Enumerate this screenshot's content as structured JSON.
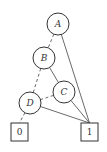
{
  "diagram": {
    "type": "binary-decision-diagram",
    "nodes": [
      {
        "id": "A",
        "label": "A",
        "kind": "variable"
      },
      {
        "id": "B",
        "label": "B",
        "kind": "variable"
      },
      {
        "id": "C",
        "label": "C",
        "kind": "variable"
      },
      {
        "id": "D",
        "label": "D",
        "kind": "variable"
      },
      {
        "id": "T0",
        "label": "0",
        "kind": "terminal"
      },
      {
        "id": "T1",
        "label": "1",
        "kind": "terminal"
      }
    ],
    "edges": [
      {
        "from": "A",
        "to": "B",
        "style": "dashed"
      },
      {
        "from": "A",
        "to": "T1",
        "style": "solid"
      },
      {
        "from": "B",
        "to": "D",
        "style": "dashed"
      },
      {
        "from": "B",
        "to": "C",
        "style": "solid"
      },
      {
        "from": "C",
        "to": "D",
        "style": "dashed"
      },
      {
        "from": "C",
        "to": "T1",
        "style": "solid"
      },
      {
        "from": "D",
        "to": "T0",
        "style": "dashed"
      },
      {
        "from": "D",
        "to": "T1",
        "style": "solid"
      }
    ]
  }
}
